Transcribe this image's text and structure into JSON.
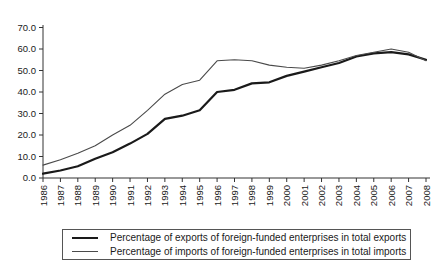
{
  "chart_data": {
    "type": "line",
    "title": "",
    "xlabel": "",
    "ylabel": "",
    "x": [
      1986,
      1987,
      1988,
      1989,
      1990,
      1991,
      1992,
      1993,
      1994,
      1995,
      1996,
      1997,
      1998,
      1999,
      2000,
      2001,
      2002,
      2003,
      2004,
      2005,
      2006,
      2007,
      2008
    ],
    "series": [
      {
        "name": "Percentage of exports of foreign-funded enterprises in total exports",
        "values": [
          2,
          3.5,
          5.5,
          9,
          12,
          16,
          20.5,
          27.5,
          29,
          31.5,
          40,
          41,
          44,
          44.5,
          47.5,
          49.5,
          51.5,
          53.5,
          56.5,
          58,
          58.5,
          57.5,
          55
        ],
        "color": "#1a1a1a",
        "stroke_width": 2.2
      },
      {
        "name": "Percentage of imports of foreign-funded enterprises in total imports",
        "values": [
          6,
          8.5,
          11.5,
          15,
          20,
          24.5,
          31.5,
          39,
          43.5,
          45.5,
          54.5,
          55,
          54.5,
          52.5,
          51.5,
          51,
          52.5,
          54.5,
          57,
          58.5,
          60,
          58.5,
          54.5
        ],
        "color": "#4a4a4a",
        "stroke_width": 1.1
      }
    ],
    "ylim": [
      0,
      70
    ],
    "ytick_step": 10,
    "ytick_decimals": 1,
    "grid": false,
    "legend_position": "bottom",
    "x_label_rotation_deg": -90,
    "axis_color": "#333333",
    "tick_label_color": "#1a1a1a",
    "tick_label_font_px": 9.5
  }
}
